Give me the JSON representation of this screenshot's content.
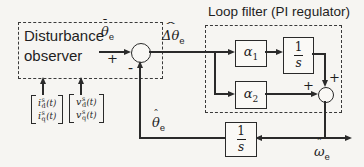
{
  "canvas": {
    "background": "#f6f5f2",
    "ink": "#2a2a2a"
  },
  "disturbance_observer": {
    "label": "Disturbance observer"
  },
  "loop_filter": {
    "title": "Loop filter (PI regulator)"
  },
  "blocks": {
    "alpha1": {
      "base": "α",
      "sub": "1"
    },
    "alpha2": {
      "base": "α",
      "sub": "2"
    },
    "integrator_loop": {
      "num": "1",
      "den": "s"
    },
    "integrator_feedback": {
      "num": "1",
      "den": "s"
    }
  },
  "signals": {
    "theta_bar": {
      "accent": "¯",
      "base": "θ",
      "sub": "e"
    },
    "delta_theta_hat": {
      "accent": "ˆ",
      "base": "Δθ",
      "sub": "e"
    },
    "theta_hat": {
      "accent": "ˆ",
      "base": "θ",
      "sub": "e"
    },
    "omega_hat": {
      "accent": "ˆ",
      "base": "ω",
      "sub": "e"
    }
  },
  "signs": {
    "sum1_plus": "+",
    "sum1_minus": "-",
    "sum2_plus_top": "+",
    "sum2_plus_left": "+"
  },
  "inputs": {
    "current_vector": {
      "rows": [
        {
          "base": "i",
          "sup": "s",
          "sub": "d",
          "arg": "(t)"
        },
        {
          "base": "i",
          "sup": "s",
          "sub": "q",
          "arg": "(t)"
        }
      ]
    },
    "voltage_vector": {
      "rows": [
        {
          "base": "v",
          "sup": "s",
          "sub": "d",
          "arg": "(t)"
        },
        {
          "base": "v",
          "sup": "s",
          "sub": "q",
          "arg": "(t)"
        }
      ]
    }
  }
}
